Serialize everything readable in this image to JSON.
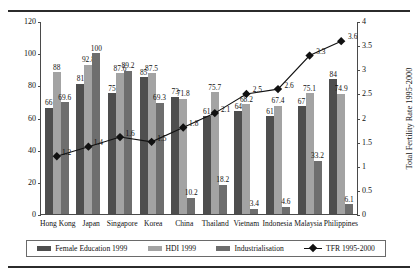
{
  "chart_data": {
    "type": "bar",
    "title": "",
    "xlabel": "",
    "ylabel": "",
    "ylim": [
      0,
      120
    ],
    "y2lim": [
      0,
      4
    ],
    "y2label": "Total Fertility Rate 1995-2000",
    "grid": false,
    "legend_position": "bottom",
    "categories": [
      "Hong Kong",
      "Japan",
      "Singapore",
      "Korea",
      "China",
      "Thailand",
      "Vietnam",
      "Indonesia",
      "Malaysia",
      "Philippines"
    ],
    "yticks": [
      "0",
      "20",
      "40",
      "60",
      "80",
      "100",
      "120"
    ],
    "y2ticks": [
      "0",
      "0.5",
      "1",
      "1.5",
      "2",
      "2.5",
      "3",
      "3.5",
      "4"
    ],
    "series": [
      {
        "name": "Female Education 1999",
        "color": "#4e4e4e",
        "axis": "left",
        "values": [
          66,
          81,
          75,
          85,
          73,
          61,
          64,
          61,
          67,
          84
        ]
      },
      {
        "name": "HDI 1999",
        "color": "#a3a3a3",
        "axis": "left",
        "values": [
          88,
          92.8,
          87.6,
          87.5,
          71.8,
          75.7,
          68.2,
          67.4,
          75.1,
          74.9
        ]
      },
      {
        "name": "Industrialisation",
        "color": "#6e6e6e",
        "axis": "left",
        "values": [
          69.6,
          100,
          89.2,
          69.3,
          10.2,
          18.2,
          3.4,
          4.6,
          33.2,
          6.1
        ]
      },
      {
        "name": "TFR 1995-2000",
        "color": "#111111",
        "axis": "right",
        "type": "line",
        "values": [
          1.2,
          1.4,
          1.6,
          1.5,
          1.8,
          2.1,
          2.5,
          2.6,
          3.3,
          3.6
        ]
      }
    ]
  },
  "legend": {
    "items": [
      {
        "label": "Female Education 1999"
      },
      {
        "label": "HDI 1999"
      },
      {
        "label": "Industrialisation"
      },
      {
        "label": "TFR 1995-2000"
      }
    ]
  }
}
